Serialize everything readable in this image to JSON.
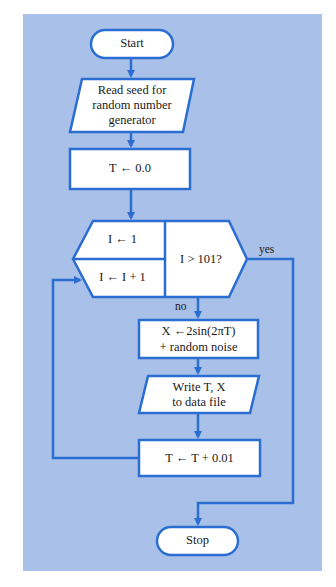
{
  "flowchart": {
    "colors": {
      "background": "#a9c0e8",
      "line": "#2a6ed2",
      "node_fill": "#ffffff",
      "text": "#1a1a1a"
    },
    "nodes": {
      "start": {
        "type": "terminator",
        "label": "Start"
      },
      "read_seed": {
        "type": "io",
        "line1": "Read seed for",
        "line2": "random number",
        "line3": "generator"
      },
      "init_t": {
        "type": "process",
        "label": "T ← 0.0"
      },
      "loop_init": {
        "type": "loop",
        "label": "I ← 1"
      },
      "loop_incr": {
        "type": "loop",
        "label": "I ← I + 1"
      },
      "loop_test": {
        "type": "decision",
        "label": "I > 101?"
      },
      "compute_x": {
        "type": "process",
        "line1": "X ←2sin(2πT)",
        "line2": "+ random noise"
      },
      "write": {
        "type": "io",
        "line1": "Write T, X",
        "line2": "to data file"
      },
      "incr_t": {
        "type": "process",
        "label": "T ← T + 0.01"
      },
      "stop": {
        "type": "terminator",
        "label": "Stop"
      }
    },
    "edge_labels": {
      "yes": "yes",
      "no": "no"
    }
  }
}
